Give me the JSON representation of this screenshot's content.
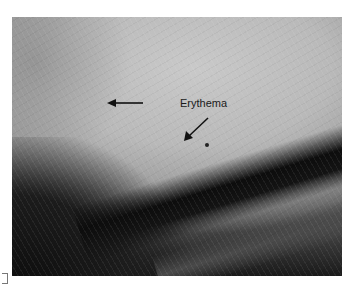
{
  "figure": {
    "annotations": [
      {
        "type": "arrow",
        "direction": "left",
        "label": ""
      },
      {
        "type": "arrow",
        "direction": "down-left",
        "label": "Erythema"
      }
    ],
    "label_text": "Erythema",
    "caption": ""
  }
}
